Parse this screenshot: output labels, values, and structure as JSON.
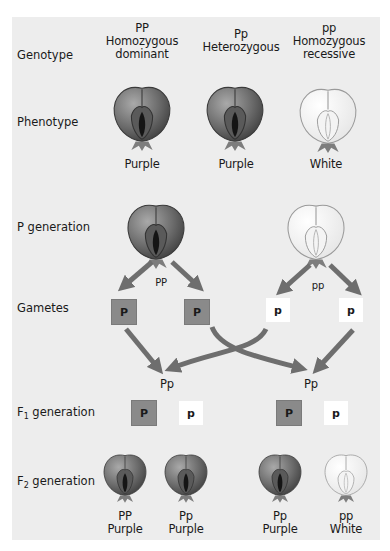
{
  "rows": {
    "genotype": "Genotype",
    "phenotype": "Phenotype",
    "p_generation": "P generation",
    "gametes": "Gametes",
    "f1_generation_prefix": "F",
    "f1_generation_sub": "1",
    "f1_generation_suffix": " generation",
    "f2_generation_prefix": "F",
    "f2_generation_sub": "2",
    "f2_generation_suffix": " generation"
  },
  "genotype_columns": [
    {
      "code": "PP",
      "line1": "Homozygous",
      "line2": "dominant"
    },
    {
      "code": "Pp",
      "line1": "Heterozygous",
      "line2": ""
    },
    {
      "code": "pp",
      "line1": "Homozygous",
      "line2": "recessive"
    }
  ],
  "phenotypes": [
    {
      "label": "Purple",
      "color": "purple"
    },
    {
      "label": "Purple",
      "color": "purple"
    },
    {
      "label": "White",
      "color": "white"
    }
  ],
  "p_generation": [
    {
      "genotype": "PP",
      "color": "purple"
    },
    {
      "genotype": "pp",
      "color": "white"
    }
  ],
  "gametes": [
    "P",
    "P",
    "p",
    "p"
  ],
  "f1_offspring_labels": [
    "Pp",
    "Pp"
  ],
  "f1_gametes": [
    "P",
    "p",
    "P",
    "p"
  ],
  "f2": [
    {
      "genotype": "PP",
      "phenotype": "Purple",
      "color": "purple"
    },
    {
      "genotype": "Pp",
      "phenotype": "Purple",
      "color": "purple"
    },
    {
      "genotype": "Pp",
      "phenotype": "Purple",
      "color": "purple"
    },
    {
      "genotype": "pp",
      "phenotype": "White",
      "color": "white"
    }
  ],
  "colors": {
    "panel": "#ededed",
    "dominant_box": "#8a8a8a",
    "recessive_box": "#ffffff",
    "arrow": "#6e6e6e",
    "purple_flower": "#6f6f6f",
    "white_flower": "#fafafa"
  }
}
